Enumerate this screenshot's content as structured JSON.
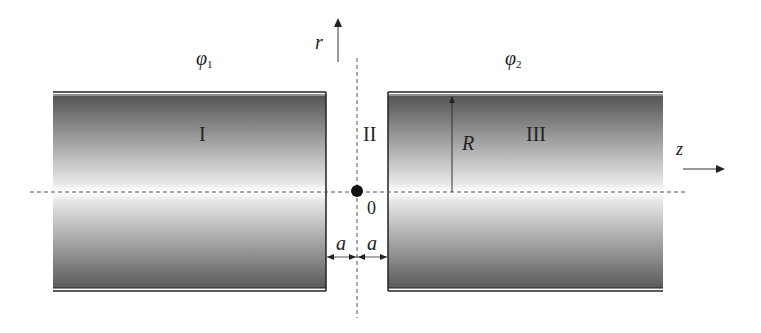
{
  "diagram": {
    "title": "",
    "labels": {
      "phi1": "φ",
      "phi1_sub": "1",
      "phi2": "φ",
      "phi2_sub": "2",
      "r_axis": "r",
      "z_axis": "z",
      "region1": "I",
      "region2": "II",
      "region3": "III",
      "radius": "R",
      "origin": "0",
      "gap_left": "a",
      "gap_right": "a"
    },
    "elements": [
      {
        "name": "left-cylinder",
        "region": "I",
        "potential": "φ1"
      },
      {
        "name": "gap",
        "region": "II"
      },
      {
        "name": "right-cylinder",
        "region": "III",
        "potential": "φ2"
      }
    ],
    "colors": {
      "dark": "#4a4a4a",
      "light": "#ffffff",
      "line": "#222222"
    }
  }
}
